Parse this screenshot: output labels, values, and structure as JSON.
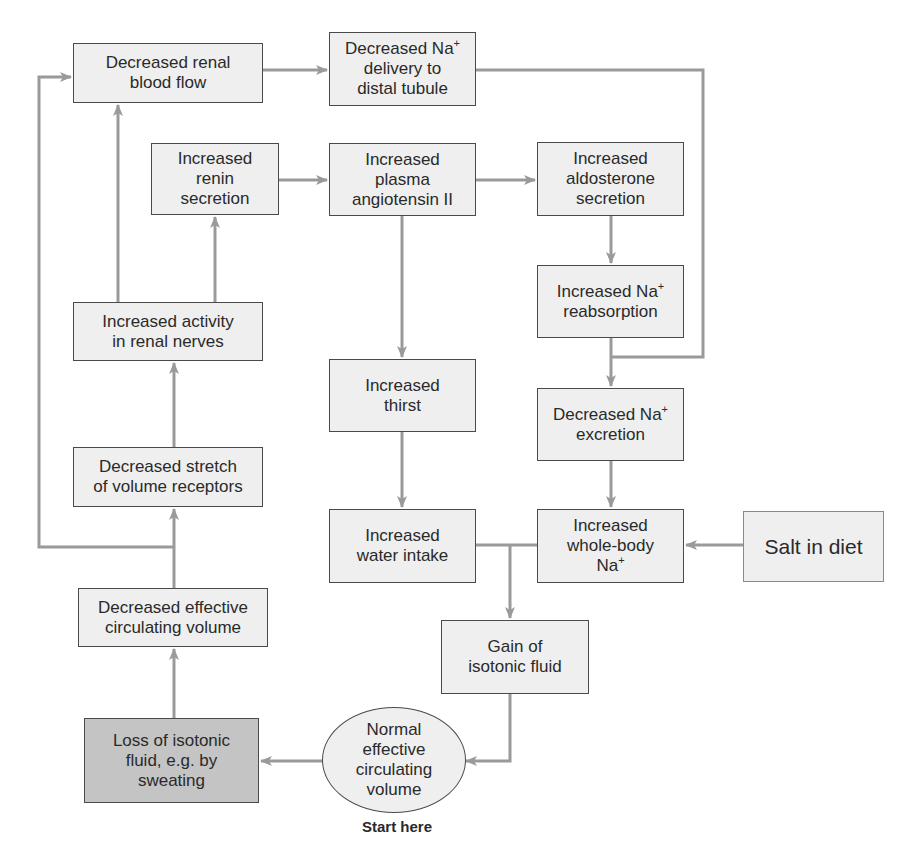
{
  "diagram": {
    "nodes": {
      "decreased_renal_blood_flow": {
        "lines": [
          "Decreased renal",
          "blood flow"
        ]
      },
      "decreased_na_delivery": {
        "lines": [
          "Decreased Na",
          "delivery to",
          "distal tubule"
        ],
        "superscript": "+"
      },
      "increased_renin": {
        "lines": [
          "Increased",
          "renin",
          "secretion"
        ]
      },
      "increased_angiotensin": {
        "lines": [
          "Increased",
          "plasma",
          "angiotensin II"
        ]
      },
      "increased_aldosterone": {
        "lines": [
          "Increased",
          "aldosterone",
          "secretion"
        ]
      },
      "increased_renal_nerves": {
        "lines": [
          "Increased activity",
          "in renal nerves"
        ]
      },
      "increased_na_reabsorption": {
        "lines": [
          "Increased Na",
          "reabsorption"
        ],
        "superscript": "+"
      },
      "increased_thirst": {
        "lines": [
          "Increased",
          "thirst"
        ]
      },
      "decreased_na_excretion": {
        "lines": [
          "Decreased Na",
          "excretion"
        ],
        "superscript": "+"
      },
      "decreased_stretch": {
        "lines": [
          "Decreased stretch",
          "of volume receptors"
        ]
      },
      "increased_water_intake": {
        "lines": [
          "Increased",
          "water intake"
        ]
      },
      "increased_whole_body_na": {
        "lines": [
          "Increased",
          "whole-body",
          "Na"
        ],
        "superscript": "+"
      },
      "salt_in_diet": {
        "lines": [
          "Salt in diet"
        ]
      },
      "decreased_effective_volume": {
        "lines": [
          "Decreased effective",
          "circulating volume"
        ]
      },
      "gain_isotonic_fluid": {
        "lines": [
          "Gain of",
          "isotonic fluid"
        ]
      },
      "loss_isotonic_fluid": {
        "lines": [
          "Loss of isotonic",
          "fluid, e.g. by",
          "sweating"
        ]
      },
      "normal_effective_volume": {
        "lines": [
          "Normal",
          "effective",
          "circulating",
          "volume"
        ]
      }
    },
    "start_label": "Start here",
    "colors": {
      "box_fill": "#efefef",
      "start_box_fill": "#c4c4c4",
      "border": "#4a4a4a",
      "arrow": "#999999",
      "text": "#2a2a2a"
    }
  }
}
